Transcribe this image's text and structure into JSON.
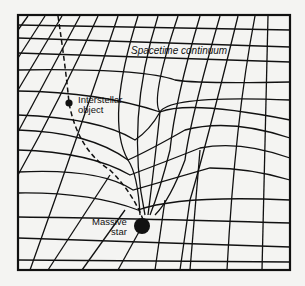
{
  "diagram": {
    "title": "Spacetime continuum",
    "labels": {
      "object_line1": "Interstellar",
      "object_line2": "object",
      "star_line1": "Massive",
      "star_line2": "star"
    },
    "colors": {
      "background": "#f4f4f2",
      "line": "#111111"
    },
    "elements": [
      {
        "name": "spacetime-grid",
        "type": "warped grid"
      },
      {
        "name": "interstellar-object",
        "type": "small dot"
      },
      {
        "name": "trajectory",
        "type": "dashed curve from top-left to star"
      },
      {
        "name": "massive-star",
        "type": "large dot at bottom of gravity well"
      }
    ]
  }
}
